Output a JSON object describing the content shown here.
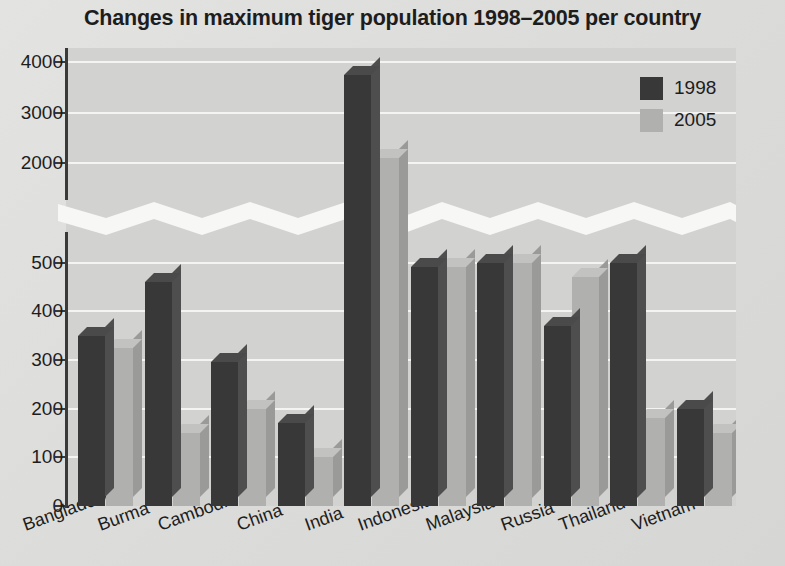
{
  "chart_data": {
    "type": "bar",
    "title": "Changes in maximum tiger population 1998–2005 per country",
    "xlabel": "",
    "ylabel": "",
    "grid": true,
    "legend_position": "top-right",
    "broken_axis": true,
    "axis_break_between": [
      500,
      2000
    ],
    "ylim_lower": [
      0,
      500
    ],
    "ylim_upper": [
      2000,
      4000
    ],
    "ytick_labels_lower": [
      "0",
      "100",
      "200",
      "300",
      "400",
      "500"
    ],
    "ytick_labels_upper": [
      "2000",
      "3000",
      "4000"
    ],
    "categories": [
      "Bangladesh",
      "Burma",
      "Cambodia",
      "China",
      "India",
      "Indonesia",
      "Malaysia",
      "Russia",
      "Thailand",
      "Vietnam"
    ],
    "series": [
      {
        "name": "1998",
        "color": "#383838",
        "values": [
          350,
          460,
          295,
          170,
          3750,
          490,
          500,
          370,
          500,
          200
        ]
      },
      {
        "name": "2005",
        "color": "#b0b0ae",
        "values": [
          325,
          150,
          200,
          100,
          2100,
          490,
          500,
          470,
          180,
          150
        ]
      }
    ]
  },
  "legend": {
    "items": [
      {
        "label": "1998",
        "color": "#383838"
      },
      {
        "label": "2005",
        "color": "#b0b0ae"
      }
    ]
  }
}
